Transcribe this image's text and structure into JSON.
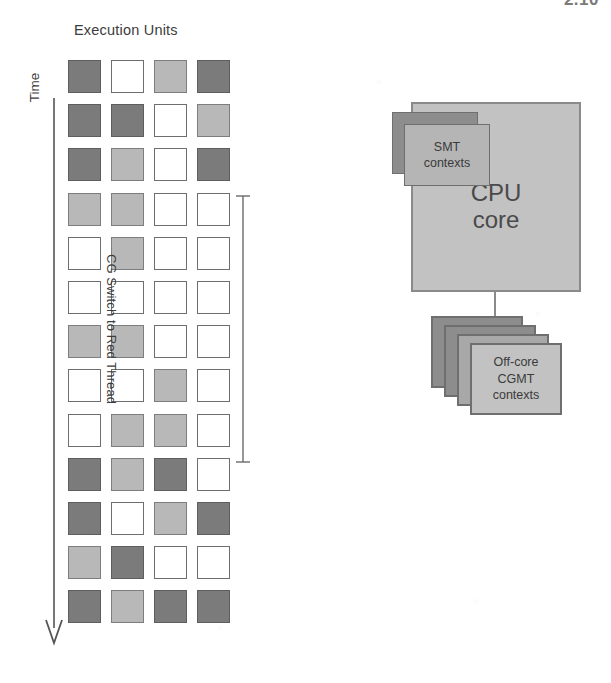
{
  "page": {
    "top_right_artifact": "2.10",
    "background_color": "#ffffff"
  },
  "left_panel": {
    "title": "Execution Units",
    "time_axis": {
      "label": "Time",
      "direction": "down",
      "arrow_icon": "down-arrow-icon"
    },
    "bracket": {
      "label": "CG Switch to Red Thread",
      "spans_rows": [
        4,
        10
      ]
    },
    "legend_colors": {
      "dark": "#7b7b7b",
      "light": "#b8b8b8",
      "empty": "#ffffff",
      "border": "#6e6e6e"
    }
  },
  "chart_data": {
    "type": "heatmap",
    "title": "Execution Units",
    "xlabel": "Execution Units",
    "ylabel": "Time",
    "columns": [
      "EU1",
      "EU2",
      "EU3",
      "EU4"
    ],
    "rows": [
      "t1",
      "t2",
      "t3",
      "t4",
      "t5",
      "t6",
      "t7",
      "t8",
      "t9",
      "t10",
      "t11",
      "t12",
      "t13"
    ],
    "states": [
      "dark",
      "light",
      "empty"
    ],
    "grid": [
      [
        "dark",
        "empty",
        "light",
        "dark"
      ],
      [
        "dark",
        "dark",
        "empty",
        "light"
      ],
      [
        "dark",
        "light",
        "empty",
        "dark"
      ],
      [
        "light",
        "light",
        "empty",
        "empty"
      ],
      [
        "empty",
        "light",
        "empty",
        "empty"
      ],
      [
        "empty",
        "empty",
        "empty",
        "empty"
      ],
      [
        "light",
        "light",
        "empty",
        "empty"
      ],
      [
        "empty",
        "empty",
        "light",
        "empty"
      ],
      [
        "empty",
        "light",
        "light",
        "empty"
      ],
      [
        "dark",
        "light",
        "dark",
        "empty"
      ],
      [
        "dark",
        "empty",
        "light",
        "dark"
      ],
      [
        "light",
        "dark",
        "empty",
        "empty"
      ],
      [
        "dark",
        "light",
        "dark",
        "dark"
      ]
    ]
  },
  "right_panel": {
    "cpu_core": {
      "label_line1": "CPU",
      "label_line2": "core",
      "fill_color": "#c2c2c2",
      "border_color": "#8a8a8a"
    },
    "smt_contexts": {
      "label_line1": "SMT",
      "label_line2": "contexts",
      "fill_color": "#b5b5b5",
      "shadow_color": "#8d8d8d",
      "stack_count": 2
    },
    "offcore_cgmt": {
      "label_line1": "Off-core",
      "label_line2": "CGMT",
      "label_line3": "contexts",
      "fill_color": "#c2c2c2",
      "shadow_color": "#8d8d8d",
      "stack_count": 4
    }
  }
}
